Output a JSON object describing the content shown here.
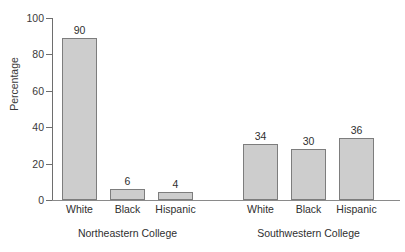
{
  "chart_data": {
    "type": "bar",
    "title": "",
    "xlabel": "",
    "ylabel": "Percentage",
    "ylim": [
      0,
      100
    ],
    "yticks": [
      0,
      20,
      40,
      60,
      80,
      100
    ],
    "grid": false,
    "legend": "none",
    "categories": [
      "White",
      "Black",
      "Hispanic"
    ],
    "groups": [
      {
        "name": "Northeastern College",
        "values": [
          90,
          6,
          4
        ]
      },
      {
        "name": "Southwestern College",
        "values": [
          34,
          30,
          36
        ]
      }
    ],
    "bars": [
      {
        "group": "Northeastern College",
        "category": "White",
        "value": 90,
        "label": "90",
        "x": 62,
        "width": 35,
        "render_value": 89
      },
      {
        "group": "Northeastern College",
        "category": "Black",
        "value": 6,
        "label": "6",
        "x": 110,
        "width": 35,
        "render_value": 6
      },
      {
        "group": "Northeastern College",
        "category": "Hispanic",
        "value": 4,
        "label": "4",
        "x": 158,
        "width": 35,
        "render_value": 4.3
      },
      {
        "group": "Southwestern College",
        "category": "White",
        "value": 34,
        "label": "34",
        "x": 243,
        "width": 35,
        "render_value": 31
      },
      {
        "group": "Southwestern College",
        "category": "Black",
        "value": 30,
        "label": "30",
        "x": 291,
        "width": 35,
        "render_value": 28.2
      },
      {
        "group": "Southwestern College",
        "category": "Hispanic",
        "value": 36,
        "label": "36",
        "x": 339,
        "width": 35,
        "render_value": 34.3
      }
    ],
    "colors": {
      "bar_fill": "#cdcdcd",
      "bar_border": "#7d7d7d",
      "axis": "#6e6e6e",
      "text": "#2f2f2f",
      "background": "#ffffff"
    }
  }
}
